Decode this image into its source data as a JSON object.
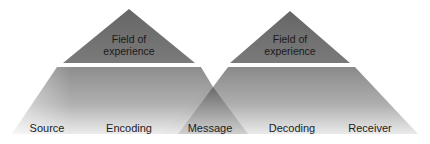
{
  "diagram": {
    "left_pyramid": {
      "field_label_line1": "Field of",
      "field_label_line2": "experience"
    },
    "right_pyramid": {
      "field_label_line1": "Field of",
      "field_label_line2": "experience"
    },
    "base_labels": {
      "source": "Source",
      "encoding": "Encoding",
      "message": "Message",
      "decoding": "Decoding",
      "receiver": "Receiver"
    },
    "colors": {
      "apex_fill": "#6e6e6e",
      "base_top": "#8a8a8a",
      "base_bottom": "#e6e6e6",
      "overlap": "#7c7c7c",
      "band": "#ffffff"
    }
  }
}
